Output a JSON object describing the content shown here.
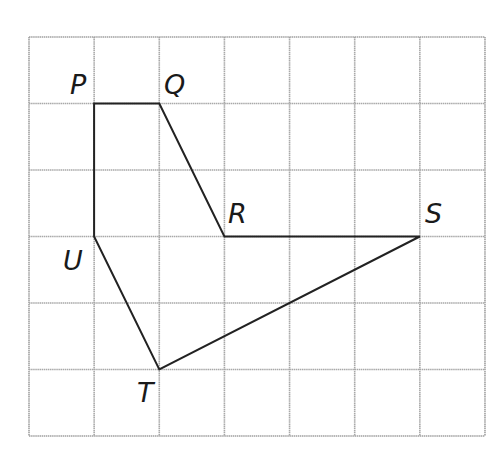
{
  "diagram": {
    "type": "grid-polygon",
    "grid": {
      "columns": 7,
      "rows": 6,
      "origin_px": [
        29,
        37
      ],
      "cell_w": 65.14,
      "cell_h": 66.5,
      "line_color": "#a8a8a8",
      "border_color": "#a0a0a0"
    },
    "shape_color": "#222222",
    "points": [
      {
        "name": "P",
        "grid": [
          1,
          1
        ],
        "label": "P",
        "label_pos": [
          70,
          94
        ]
      },
      {
        "name": "Q",
        "grid": [
          2,
          1
        ],
        "label": "Q",
        "label_pos": [
          164,
          94
        ]
      },
      {
        "name": "R",
        "grid": [
          3,
          3
        ],
        "label": "R",
        "label_pos": [
          228,
          223
        ]
      },
      {
        "name": "S",
        "grid": [
          6,
          3
        ],
        "label": "S",
        "label_pos": [
          425,
          223
        ]
      },
      {
        "name": "T",
        "grid": [
          2,
          5
        ],
        "label": "T",
        "label_pos": [
          137,
          402
        ]
      },
      {
        "name": "U",
        "grid": [
          1,
          3
        ],
        "label": "U",
        "label_pos": [
          63,
          270
        ]
      }
    ],
    "polygon_order": [
      "P",
      "Q",
      "R",
      "S",
      "T",
      "U"
    ]
  }
}
